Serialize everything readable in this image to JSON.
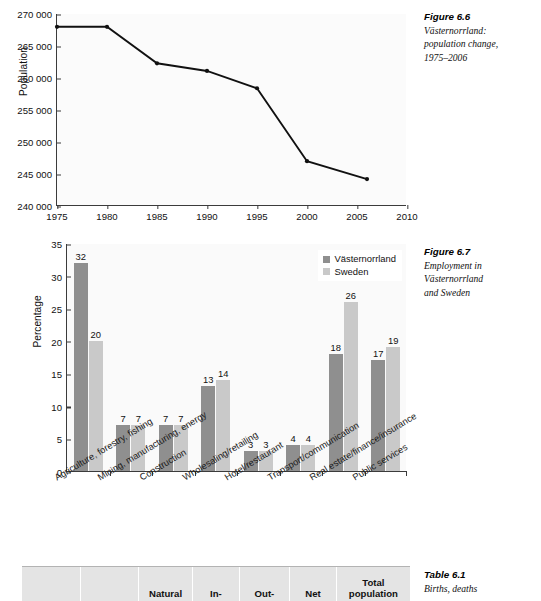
{
  "figure_66": {
    "caption_head": "Figure 6.6",
    "caption_lines": [
      "Västernorrland:",
      "population change,",
      "1975–2006"
    ]
  },
  "figure_67": {
    "caption_head": "Figure 6.7",
    "caption_lines": [
      "Employment in",
      "Västernorrland",
      "and Sweden"
    ]
  },
  "table_61": {
    "caption_head": "Table 6.1",
    "caption_lines": [
      "Births, deaths"
    ],
    "headers": [
      "",
      "",
      "Natural",
      "In-",
      "Out-",
      "Net",
      "Total\npopulation"
    ],
    "header_cells": [
      {
        "line1": "",
        "line2": ""
      },
      {
        "line1": "",
        "line2": ""
      },
      {
        "line1": "",
        "line2": "Natural"
      },
      {
        "line1": "",
        "line2": "In-"
      },
      {
        "line1": "",
        "line2": "Out-"
      },
      {
        "line1": "",
        "line2": "Net"
      },
      {
        "line1": "Total",
        "line2": "population"
      }
    ]
  },
  "chart_data": [
    {
      "id": "fig66",
      "type": "line",
      "title": "Västernorrland: population change, 1975-2006",
      "xlabel": "",
      "ylabel": "Population",
      "xlim": [
        1975,
        2010
      ],
      "ylim": [
        240000,
        270000
      ],
      "xticks": [
        "1975",
        "1980",
        "1985",
        "1990",
        "1995",
        "2000",
        "2005",
        "2010"
      ],
      "xtick_values": [
        1975,
        1980,
        1985,
        1990,
        1995,
        2000,
        2005,
        2010
      ],
      "yticks": [
        "240 000",
        "245 000",
        "250 000",
        "255 000",
        "260 000",
        "265 000",
        "270 000"
      ],
      "ytick_values": [
        240000,
        245000,
        250000,
        255000,
        260000,
        265000,
        270000
      ],
      "grid": false,
      "legend": "none",
      "line_color": "#111111",
      "x": [
        1975,
        1980,
        1985,
        1990,
        1995,
        2000,
        2006
      ],
      "values": [
        268000,
        268000,
        262300,
        261100,
        258400,
        247000,
        244200
      ]
    },
    {
      "id": "fig67",
      "type": "bar",
      "title": "Employment in Västernorrland and Sweden",
      "xlabel": "",
      "ylabel": "Percentage",
      "ylim": [
        0,
        35
      ],
      "yticks": [
        "0",
        "5",
        "10",
        "15",
        "20",
        "25",
        "30",
        "35"
      ],
      "ytick_values": [
        0,
        5,
        10,
        15,
        20,
        25,
        30,
        35
      ],
      "grid": false,
      "legend": "top-right",
      "categories": [
        "Agriculture, forestry, fishing",
        "Mining, manufacturing, energy",
        "Construction",
        "Wholesaling/retailing",
        "Hotel/restaurant",
        "Transport/communication",
        "Real estate/finance/insurance",
        "Public services"
      ],
      "series": [
        {
          "name": "Västernorrland",
          "color": "#8f8f8f",
          "values": [
            32,
            7,
            7,
            13,
            3,
            4,
            18,
            17
          ]
        },
        {
          "name": "Sweden",
          "color": "#c9c9c9",
          "values": [
            20,
            7,
            7,
            14,
            3,
            4,
            26,
            19
          ]
        }
      ]
    }
  ]
}
